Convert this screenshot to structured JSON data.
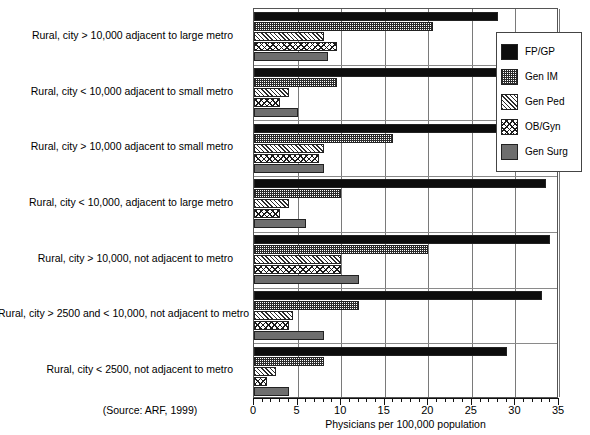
{
  "chart_data": {
    "type": "bar",
    "orientation": "horizontal",
    "title": "",
    "xlabel": "Physicians per 100,000 population",
    "ylabel": "",
    "xlim": [
      0,
      35
    ],
    "xticks": [
      0,
      5,
      10,
      15,
      20,
      25,
      30,
      35
    ],
    "grid": true,
    "legend_position": "right",
    "source_note": "(Source: ARF, 1999)",
    "categories": [
      "Rural, city > 10,000 adjacent to large metro",
      "Rural, city < 10,000 adjacent to small metro",
      "Rural, city > 10,000 adjacent to small metro",
      "Rural, city < 10,000, adjacent to large metro",
      "Rural, city > 10,000, not adjacent to metro",
      "Rural, city > 2500 and < 10,000, not adjacent to metro",
      "Rural, city < 2500, not adjacent to metro"
    ],
    "series": [
      {
        "name": "FP/GP",
        "pattern": "solid-black",
        "values": [
          28.0,
          28.0,
          30.5,
          33.5,
          34.0,
          33.0,
          29.0
        ]
      },
      {
        "name": "Gen IM",
        "pattern": "checker",
        "values": [
          20.5,
          9.5,
          16.0,
          10.0,
          20.0,
          12.0,
          8.0
        ]
      },
      {
        "name": "Gen Ped",
        "pattern": "diagonal-hatch",
        "values": [
          8.0,
          4.0,
          8.0,
          4.0,
          10.0,
          4.5,
          2.5
        ]
      },
      {
        "name": "OB/Gyn",
        "pattern": "cross-hatch",
        "values": [
          9.5,
          3.0,
          7.5,
          3.0,
          10.0,
          4.0,
          1.5
        ]
      },
      {
        "name": "Gen Surg",
        "pattern": "solid-gray",
        "values": [
          8.5,
          5.0,
          8.0,
          6.0,
          12.0,
          8.0,
          4.0
        ]
      }
    ]
  },
  "legend": {
    "items": [
      {
        "label": "FP/GP"
      },
      {
        "label": "Gen IM"
      },
      {
        "label": "Gen Ped"
      },
      {
        "label": "OB/Gyn"
      },
      {
        "label": "Gen Surg"
      }
    ]
  }
}
